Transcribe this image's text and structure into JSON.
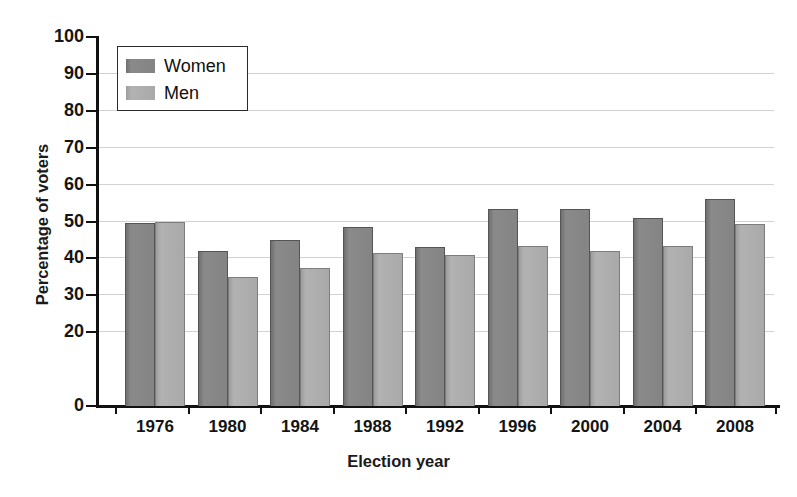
{
  "chart_data": {
    "type": "bar",
    "title": "",
    "xlabel": "Election year",
    "ylabel": "Percentage of voters",
    "categories": [
      "1976",
      "1980",
      "1984",
      "1988",
      "1992",
      "1996",
      "2000",
      "2004",
      "2008"
    ],
    "series": [
      {
        "name": "Women",
        "color": "#808080",
        "values": [
          49.5,
          42.0,
          45.0,
          48.5,
          43.0,
          53.5,
          53.5,
          51.0,
          56.0
        ]
      },
      {
        "name": "Men",
        "color": "#a9a9a9",
        "values": [
          50.0,
          35.0,
          37.5,
          41.5,
          40.8,
          43.3,
          42.0,
          43.3,
          49.3
        ]
      }
    ],
    "ylim": [
      0,
      100
    ],
    "yticks": [
      0,
      20,
      30,
      40,
      50,
      60,
      70,
      80,
      90,
      100
    ],
    "ytick_labels": [
      "0",
      "20",
      "30",
      "40",
      "50",
      "60",
      "70",
      "80",
      "90",
      "100"
    ],
    "grid": true,
    "grid_axis": "y",
    "legend_position": "upper-left"
  },
  "axes": {
    "y_title": "Percentage of voters",
    "x_title": "Election year"
  },
  "legend": {
    "entries": [
      {
        "label": "Women",
        "swatch": "women"
      },
      {
        "label": "Men",
        "swatch": "men"
      }
    ]
  },
  "caption_artifact": ""
}
